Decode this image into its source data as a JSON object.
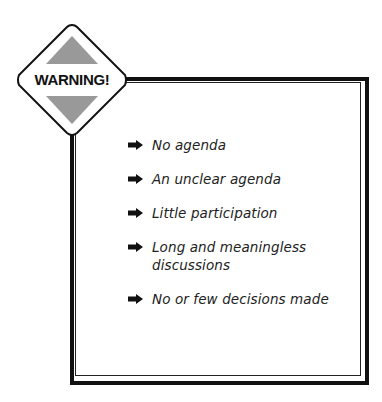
{
  "sign": {
    "label": "WARNING!",
    "icon": "warning-diamond-icon",
    "triangle_color": "#999999",
    "border_color": "#111111"
  },
  "list": {
    "bullet_icon": "arrow-right-icon",
    "items": [
      {
        "text": "No agenda"
      },
      {
        "text": "An unclear agenda"
      },
      {
        "text": "Little participation"
      },
      {
        "text": "Long and meaningless discussions"
      },
      {
        "text": "No or few decisions made"
      }
    ]
  }
}
